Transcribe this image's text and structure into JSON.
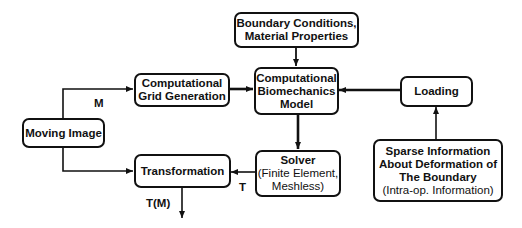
{
  "diagram": {
    "nodes": {
      "boundary": {
        "line1": "Boundary Conditions,",
        "line2": "Material Properties"
      },
      "model": {
        "line1": "Computational",
        "line2": "Biomechanics",
        "line3": "Model"
      },
      "grid": {
        "line1": "Computational",
        "line2": "Grid Generation"
      },
      "loading": {
        "line1": "Loading"
      },
      "moving": {
        "line1": "Moving Image"
      },
      "transformation": {
        "line1": "Transformation"
      },
      "solver": {
        "line1": "Solver",
        "line2": "(Finite Element,",
        "line3": "Meshless)"
      },
      "sparse": {
        "line1": "Sparse Information",
        "line2": "About Deformation of",
        "line3": "The Boundary",
        "line4": "(Intra-op. Information)"
      }
    },
    "edge_labels": {
      "m": "M",
      "t": "T",
      "tm": "T(M)"
    },
    "edges": [
      {
        "from": "moving",
        "to": "grid",
        "label": "M"
      },
      {
        "from": "moving",
        "to": "transformation"
      },
      {
        "from": "grid",
        "to": "model"
      },
      {
        "from": "boundary",
        "to": "model"
      },
      {
        "from": "loading",
        "to": "model"
      },
      {
        "from": "sparse",
        "to": "loading"
      },
      {
        "from": "model",
        "to": "solver"
      },
      {
        "from": "solver",
        "to": "transformation",
        "label": "T"
      },
      {
        "from": "transformation",
        "to": "output",
        "label": "T(M)"
      }
    ]
  }
}
